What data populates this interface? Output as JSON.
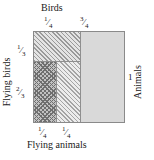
{
  "diagram": {
    "type": "area-proportion-square",
    "top_axis": {
      "title": "Birds",
      "ticks": [
        {
          "num": "1",
          "slash": "⁄",
          "den": "4"
        },
        {
          "num": "3",
          "slash": "⁄",
          "den": "4"
        }
      ]
    },
    "left_axis": {
      "title": "Flying birds",
      "ticks": [
        {
          "num": "1",
          "slash": "⁄",
          "den": "3"
        },
        {
          "num": "2",
          "slash": "⁄",
          "den": "3"
        }
      ]
    },
    "right_axis": {
      "title": "Animals",
      "value": "1"
    },
    "bottom_axis": {
      "title": "Flying animals",
      "ticks": [
        {
          "num": "1",
          "slash": "⁄",
          "den": "4"
        },
        {
          "num": "1",
          "slash": "⁄",
          "den": "4"
        }
      ]
    },
    "regions": [
      {
        "name": "birds-flying",
        "fill": "diagonal-hatch",
        "width_fraction": "1/4",
        "height_fraction": "1/3"
      },
      {
        "name": "flying-birds",
        "fill": "dark-cross-hatch",
        "width_fraction": "1/4",
        "height_fraction": "2/3"
      },
      {
        "name": "flying-nonbirds",
        "fill": "light-diagonal-hatch",
        "width_fraction": "1/4",
        "height_fraction": "2/3"
      },
      {
        "name": "rest",
        "fill": "solid-gray",
        "width_fraction": "3/4",
        "height_fraction": "1"
      }
    ],
    "colors": {
      "box_border": "#8a8a8a",
      "solid_fill": "#d9d9d9",
      "hatch_dark": "#6f6f6f",
      "hatch_mid": "#9a9a9a",
      "hatch_light": "#a5a5a5",
      "text": "#1a1a1a"
    }
  },
  "chart_data": {
    "type": "area",
    "title": "",
    "xlabel_top": "Birds",
    "xlabel_bottom": "Flying animals",
    "ylabel_left": "Flying birds",
    "ylabel_right": "Animals",
    "x_segments": [
      {
        "label": "1/4",
        "value": 0.25
      },
      {
        "label": "3/4",
        "value": 0.75
      }
    ],
    "y_segments": [
      {
        "label": "1/3",
        "value": 0.3333
      },
      {
        "label": "2/3",
        "value": 0.6667
      }
    ],
    "bottom_segments": [
      {
        "label": "1/4",
        "value": 0.25
      },
      {
        "label": "1/4",
        "value": 0.25
      }
    ],
    "total": 1
  }
}
